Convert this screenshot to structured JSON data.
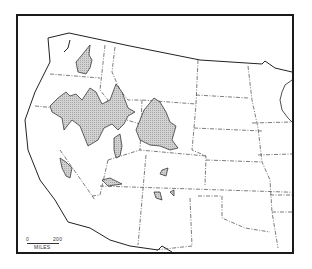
{
  "map": {
    "region": "Western United States",
    "shading": "stippled gray areas indicating distribution",
    "colors": {
      "frame": "#1a1a1a",
      "outline": "#222222",
      "state_border": "#444444",
      "shaded_fill": "#c8c8c8",
      "background": "#ffffff"
    }
  },
  "scale_bar": {
    "start_label": "0",
    "end_label": "200",
    "unit_label": "MILES"
  }
}
